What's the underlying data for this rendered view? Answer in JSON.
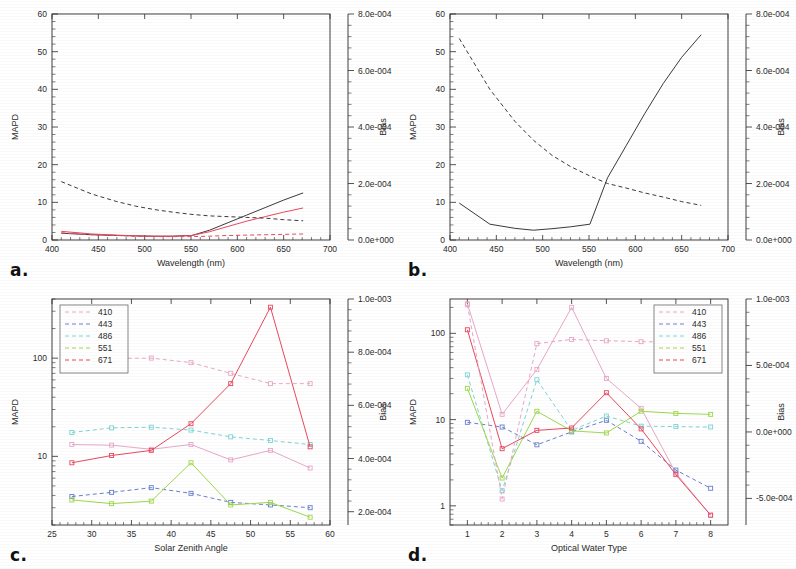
{
  "figure": {
    "panels": [
      {
        "id": "a",
        "label": "a."
      },
      {
        "id": "b",
        "label": "b."
      },
      {
        "id": "c",
        "label": "c."
      },
      {
        "id": "d",
        "label": "d."
      }
    ]
  },
  "colors": {
    "band_410": "#e8a8c8",
    "band_443": "#6a7fd0",
    "band_486": "#7fd4d4",
    "band_551": "#9ed84a",
    "band_671": "#e8495f",
    "black": "#3a3a3a",
    "axis": "#2b2b2b"
  },
  "chart_data": [
    {
      "panel": "a",
      "type": "line",
      "title": "",
      "xlabel": "Wavelength (nm)",
      "ylabel": "MAPD",
      "y2label": "Bias",
      "xlim": [
        400,
        700
      ],
      "xticks": [
        400,
        450,
        500,
        550,
        600,
        650,
        700
      ],
      "ylim": [
        0,
        60
      ],
      "yticks": [
        0,
        10,
        20,
        30,
        40,
        50,
        60
      ],
      "y2lim": [
        0.0,
        0.0008
      ],
      "y2ticks": [
        0.0,
        0.0002,
        0.0004,
        0.0006,
        0.0008
      ],
      "y2ticklabels": [
        "0.0e+000",
        "2.0e-004",
        "4.0e-004",
        "6.0e-004",
        "8.0e-004"
      ],
      "grid": false,
      "legend": "none",
      "series": [
        {
          "name": "MAPD black",
          "color": "#3a3a3a",
          "style": "solid",
          "axis": "left",
          "x": [
            410,
            443,
            470,
            490,
            510,
            530,
            551,
            570,
            590,
            610,
            630,
            650,
            671
          ],
          "y": [
            1.8,
            1.4,
            1.2,
            1.1,
            1.0,
            1.0,
            1.2,
            2.6,
            4.6,
            6.6,
            8.6,
            10.6,
            12.5
          ]
        },
        {
          "name": "MAPD red",
          "color": "#e8495f",
          "style": "solid",
          "axis": "left",
          "x": [
            410,
            443,
            470,
            490,
            510,
            530,
            551,
            570,
            590,
            610,
            630,
            650,
            671
          ],
          "y": [
            2.3,
            1.6,
            1.3,
            1.1,
            1.0,
            1.0,
            1.2,
            2.2,
            3.6,
            5.0,
            6.2,
            7.4,
            8.5
          ]
        },
        {
          "name": "Bias black dashed",
          "color": "#3a3a3a",
          "style": "dashed",
          "axis": "right",
          "x": [
            410,
            443,
            470,
            490,
            510,
            530,
            551,
            570,
            590,
            610,
            630,
            650,
            671
          ],
          "y": [
            15.5,
            12.2,
            10.2,
            9.0,
            8.1,
            7.4,
            6.8,
            6.4,
            6.2,
            6.0,
            5.8,
            5.4,
            5.1
          ]
        },
        {
          "name": "Bias red dashed",
          "color": "#e8495f",
          "style": "dashed",
          "axis": "right",
          "x": [
            410,
            443,
            470,
            490,
            510,
            530,
            551,
            570,
            590,
            610,
            630,
            650,
            671
          ],
          "y": [
            1.9,
            1.4,
            1.2,
            1.0,
            0.9,
            0.9,
            0.9,
            1.0,
            1.2,
            1.3,
            1.4,
            1.5,
            1.6
          ]
        }
      ]
    },
    {
      "panel": "b",
      "type": "line",
      "title": "",
      "xlabel": "Wavelength (nm)",
      "ylabel": "MAPD",
      "y2label": "Bias",
      "xlim": [
        400,
        700
      ],
      "xticks": [
        400,
        450,
        500,
        550,
        600,
        650,
        700
      ],
      "ylim": [
        0,
        60
      ],
      "yticks": [
        0,
        10,
        20,
        30,
        40,
        50,
        60
      ],
      "y2lim": [
        0.0,
        0.0008
      ],
      "y2ticks": [
        0.0,
        0.0002,
        0.0004,
        0.0006,
        0.0008
      ],
      "y2ticklabels": [
        "0.0e+000",
        "2.0e-004",
        "4.0e-004",
        "6.0e-004",
        "8.0e-004"
      ],
      "grid": false,
      "legend": "none",
      "series": [
        {
          "name": "MAPD solid",
          "color": "#3a3a3a",
          "style": "solid",
          "axis": "left",
          "x": [
            410,
            443,
            470,
            490,
            510,
            530,
            551,
            570,
            590,
            610,
            630,
            650,
            671
          ],
          "y": [
            9.8,
            4.2,
            3.1,
            2.6,
            3.0,
            3.5,
            4.2,
            16.5,
            25.0,
            33.5,
            41.5,
            48.5,
            54.5
          ]
        },
        {
          "name": "Bias dashed",
          "color": "#3a3a3a",
          "style": "dashed",
          "axis": "right",
          "x": [
            410,
            443,
            470,
            490,
            510,
            530,
            551,
            570,
            590,
            610,
            630,
            650,
            671
          ],
          "y": [
            53.5,
            40.0,
            31.5,
            26.5,
            22.5,
            19.5,
            17.0,
            15.0,
            13.8,
            12.5,
            11.4,
            10.2,
            9.2
          ]
        }
      ]
    },
    {
      "panel": "c",
      "type": "line",
      "xlabel": "Solar Zenith Angle",
      "ylabel": "MAPD",
      "y2label": "Bias",
      "xlim": [
        25,
        60
      ],
      "xticks": [
        25,
        30,
        35,
        40,
        45,
        50,
        55,
        60
      ],
      "yscale": "log",
      "ylim": [
        2,
        400
      ],
      "yticks": [
        10,
        100
      ],
      "y2lim": [
        0.00015,
        0.001
      ],
      "y2ticks": [
        0.0002,
        0.0004,
        0.0006,
        0.0008,
        0.001
      ],
      "y2ticklabels": [
        "2.0e-004",
        "4.0e-004",
        "6.0e-004",
        "8.0e-004",
        "1.0e-003"
      ],
      "legend": "upper-left",
      "legend_labels": [
        "410",
        "443",
        "486",
        "551",
        "671"
      ],
      "x": [
        27.5,
        32.5,
        37.5,
        42.5,
        47.5,
        52.5,
        57.5
      ],
      "series": [
        {
          "name": "410 MAPD",
          "color": "#e8a8c8",
          "style": "solid",
          "axis": "left",
          "values": [
            13.2,
            13.0,
            11.8,
            13.2,
            9.2,
            11.5,
            7.6
          ]
        },
        {
          "name": "443 MAPD",
          "color": "#6a7fd0",
          "style": "dashed",
          "axis": "left",
          "values": [
            3.9,
            4.3,
            4.8,
            4.2,
            3.4,
            3.2,
            3.0
          ]
        },
        {
          "name": "486 MAPD",
          "color": "#7fd4d4",
          "style": "dashed",
          "axis": "left",
          "values": [
            17.5,
            19.5,
            19.8,
            18.5,
            15.8,
            14.5,
            13.2
          ]
        },
        {
          "name": "551 MAPD",
          "color": "#9ed84a",
          "style": "solid",
          "axis": "left",
          "values": [
            3.6,
            3.3,
            3.5,
            8.6,
            3.2,
            3.4,
            2.4
          ]
        },
        {
          "name": "671 MAPD",
          "color": "#e8495f",
          "style": "solid",
          "axis": "left",
          "values": [
            8.6,
            10.2,
            11.5,
            21.5,
            55.0,
            330.0,
            12.5
          ]
        },
        {
          "name": "410 Bias",
          "color": "#e8a8c8",
          "style": "dashed",
          "axis": "right",
          "values": [
            99.0,
            99.5,
            100.0,
            90.0,
            70.0,
            55.0,
            55.0
          ]
        }
      ]
    },
    {
      "panel": "d",
      "type": "line",
      "xlabel": "Optical Water Type",
      "ylabel": "MAPD",
      "y2label": "Bias",
      "xlim": [
        0.5,
        8.5
      ],
      "xticks": [
        1,
        2,
        3,
        4,
        5,
        6,
        7,
        8
      ],
      "yscale": "log",
      "ylim": [
        0.6,
        250
      ],
      "yticks": [
        1,
        10,
        100
      ],
      "y2lim": [
        -0.0007,
        0.001
      ],
      "y2ticks": [
        -0.0005,
        0.0,
        0.0005,
        0.001
      ],
      "y2ticklabels": [
        "-5.0e-004",
        "0.0e+000",
        "5.0e-004",
        "1.0e-003"
      ],
      "legend": "upper-right",
      "legend_labels": [
        "410",
        "443",
        "486",
        "551",
        "671"
      ],
      "x": [
        1,
        2,
        3,
        4,
        5,
        6,
        7,
        8
      ],
      "series": [
        {
          "name": "410 MAPD",
          "color": "#e8a8c8",
          "style": "solid",
          "axis": "left",
          "values": [
            220.0,
            11.5,
            38.0,
            200.0,
            30.0,
            13.5,
            2.4,
            0.78
          ]
        },
        {
          "name": "443 MAPD",
          "color": "#6a7fd0",
          "style": "dashed",
          "axis": "left",
          "values": [
            9.3,
            8.2,
            5.1,
            7.2,
            9.8,
            5.6,
            2.6,
            1.6
          ]
        },
        {
          "name": "486 MAPD",
          "color": "#7fd4d4",
          "style": "dashed",
          "axis": "left",
          "values": [
            33.0,
            1.5,
            29.0,
            7.5,
            11.0,
            8.4,
            8.3,
            8.2
          ]
        },
        {
          "name": "551 MAPD",
          "color": "#9ed84a",
          "style": "solid",
          "axis": "left",
          "values": [
            23.0,
            2.1,
            12.5,
            7.4,
            7.0,
            12.5,
            11.8,
            11.5
          ]
        },
        {
          "name": "671 MAPD",
          "color": "#e8495f",
          "style": "solid",
          "axis": "left",
          "values": [
            110.0,
            4.6,
            7.5,
            8.0,
            20.5,
            7.8,
            2.3,
            0.78
          ]
        },
        {
          "name": "410 Bias",
          "color": "#e8a8c8",
          "style": "dashed",
          "axis": "right",
          "values": [
            215.0,
            1.2,
            76.0,
            85.0,
            82.0,
            80.0,
            79.0,
            78.0
          ]
        }
      ]
    }
  ]
}
